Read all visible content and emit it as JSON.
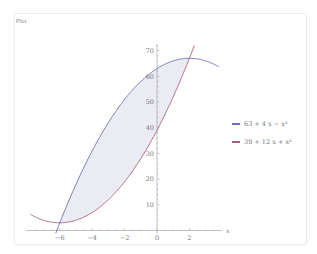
{
  "panel": {
    "label": "Plot :"
  },
  "legend": [
    {
      "label": "63 + 4 x − x²",
      "color": "#6a6db4"
    },
    {
      "label": "39 + 12 x + x²",
      "color": "#a4627a"
    }
  ],
  "chart_data": {
    "type": "line",
    "title": "",
    "xlabel": "x",
    "ylabel": "",
    "xlim": [
      -7.8,
      3.8
    ],
    "ylim": [
      0,
      73
    ],
    "x_ticks": [
      -6,
      -4,
      -2,
      0,
      2
    ],
    "y_ticks": [
      10,
      20,
      30,
      40,
      50,
      60,
      70
    ],
    "grid": false,
    "legend_position": "right",
    "series": [
      {
        "name": "63 + 4 x − x²",
        "color": "#6a6db4",
        "formula": "63 + 4x - x^2",
        "x": [
          -6,
          -5,
          -4,
          -3,
          -2,
          -1,
          0,
          1,
          2,
          3,
          3.8
        ],
        "y": [
          3,
          18,
          31,
          42,
          51,
          58,
          63,
          66,
          67,
          66,
          63.8
        ]
      },
      {
        "name": "39 + 12 x + x²",
        "color": "#a4627a",
        "formula": "39 + 12x + x^2",
        "x": [
          -7.8,
          -7,
          -6,
          -5,
          -4,
          -3,
          -2,
          -1,
          0,
          1,
          2,
          2.3
        ],
        "y": [
          6.2,
          4,
          3,
          4,
          7,
          12,
          19,
          28,
          39,
          52,
          67,
          71.9
        ]
      }
    ],
    "shaded_region": {
      "between": [
        "63 + 4 x − x²",
        "39 + 12 x + x²"
      ],
      "x_range": [
        -6,
        2
      ],
      "color": "#ebebf4"
    },
    "intersections": [
      [
        -6,
        3
      ],
      [
        2,
        67
      ]
    ]
  }
}
